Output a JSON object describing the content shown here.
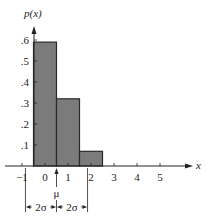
{
  "chart_data": {
    "type": "bar",
    "title": "",
    "ylabel": "p(x)",
    "xlabel": "x",
    "xlim": [
      -1.7,
      6.4
    ],
    "ylim": [
      0,
      0.66
    ],
    "x_ticks": [
      -1,
      0,
      1,
      2,
      3,
      4,
      5
    ],
    "x_tick_labels": [
      "−1",
      "0",
      "1",
      "2",
      "3",
      "4",
      "5"
    ],
    "y_ticks": [
      0.1,
      0.2,
      0.3,
      0.4,
      0.5,
      0.6
    ],
    "y_tick_labels": [
      ".1",
      ".2",
      ".3",
      ".4",
      ".5",
      ".6"
    ],
    "categories": [
      0,
      1,
      2
    ],
    "values": [
      0.59,
      0.32,
      0.07
    ],
    "bar_width": 1,
    "grid": false,
    "annotations": {
      "mu": 0.5,
      "mu_label": "μ",
      "two_sigma": 1.35,
      "left_span_label": "2σ",
      "right_span_label": "2σ"
    },
    "colors": {
      "bar_fill": "#7b7b7b",
      "bar_stroke": "#2a2a2a",
      "axis": "#222222"
    }
  }
}
